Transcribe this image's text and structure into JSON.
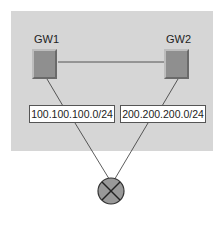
{
  "diagram": {
    "gateways": [
      {
        "id": "gw1",
        "label": "GW1"
      },
      {
        "id": "gw2",
        "label": "GW2"
      }
    ],
    "subnets": [
      {
        "label": "100.100.100.0/24"
      },
      {
        "label": "200.200.200.0/24"
      }
    ],
    "router": {
      "icon": "router-icon"
    },
    "colors": {
      "panel_bg": "#d6d6d6",
      "device_fill": "#8f8f8f",
      "router_fill": "#999999",
      "line": "#333333"
    }
  }
}
